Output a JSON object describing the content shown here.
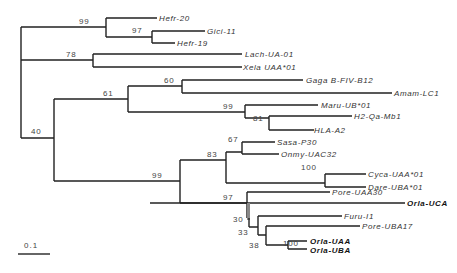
{
  "figure": {
    "type": "phylogenetic-tree",
    "scale_bar": "0.1"
  },
  "taxa": [
    {
      "name": "Hefr-20",
      "bold": false
    },
    {
      "name": "Gici-11",
      "bold": false
    },
    {
      "name": "Hefr-19",
      "bold": false
    },
    {
      "name": "Lach-UA-01",
      "bold": false
    },
    {
      "name": "Xela UAA*01",
      "bold": false
    },
    {
      "name": "Gaga B-FIV-B12",
      "bold": false
    },
    {
      "name": "Amam-LC1",
      "bold": false
    },
    {
      "name": "Maru-UB*01",
      "bold": false
    },
    {
      "name": "H2-Qa-Mb1",
      "bold": false
    },
    {
      "name": "HLA-A2",
      "bold": false
    },
    {
      "name": "Sasa-P30",
      "bold": false
    },
    {
      "name": "Onmy-UAC32",
      "bold": false
    },
    {
      "name": "Cyca-UAA*01",
      "bold": false
    },
    {
      "name": "Dare-UBA*01",
      "bold": false
    },
    {
      "name": "Pore-UAA30",
      "bold": false
    },
    {
      "name": "Orla-UCA",
      "bold": true
    },
    {
      "name": "Furu-I1",
      "bold": false
    },
    {
      "name": "Pore-UBA17",
      "bold": false
    },
    {
      "name": "Orla-UAA",
      "bold": true
    },
    {
      "name": "Orla-UBA",
      "bold": true
    }
  ],
  "bootstrap": {
    "hefr_clade": "99",
    "gici_hefr19": "97",
    "lach_xela": "78",
    "gaga_amam": "60",
    "tetrapod": "61",
    "mammal": "99",
    "h2_hla": "81",
    "teleost_root": "40",
    "teleost": "99",
    "salmon_cypr": "83",
    "sasa_onmy": "67",
    "cyca_dare": "100",
    "acanth": "97",
    "n30": "30",
    "n33": "33",
    "n38": "38",
    "orla_uaa_uba": "100"
  }
}
